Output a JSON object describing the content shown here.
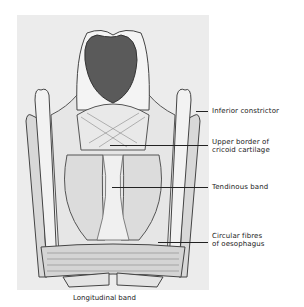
{
  "figure": {
    "labels": [
      {
        "id": "inferior-constrictor",
        "text": "Inferior constrictor"
      },
      {
        "id": "upper-border-cricoid",
        "text": "Upper border of\ncricoid cartilage"
      },
      {
        "id": "tendinous-band",
        "text": "Tendinous band"
      },
      {
        "id": "circular-fibres",
        "text": "Circular fibres\nof oesophagus"
      }
    ],
    "caption": "Longitudinal band"
  }
}
